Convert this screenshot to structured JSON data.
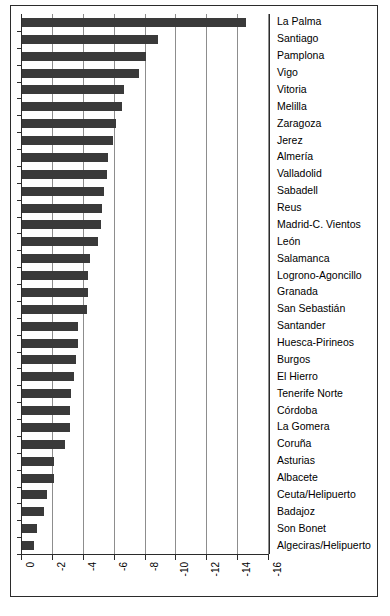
{
  "chart_data": {
    "type": "bar",
    "orientation": "horizontal",
    "title": "",
    "xlabel": "",
    "ylabel": "",
    "xlim": [
      0,
      -16
    ],
    "xticks": [
      0,
      -2,
      -4,
      -6,
      -8,
      -10,
      -12,
      -14,
      -16
    ],
    "xtick_labels": [
      "0",
      "-2",
      "-4",
      "-6",
      "-8",
      "-10",
      "-12",
      "-14",
      "-16"
    ],
    "grid": true,
    "grid_axis": "x",
    "legend": "none",
    "bar_color": "#3a3a3a",
    "axis_color": "#2b2b2b",
    "grid_color": "#8d8d8d",
    "background": "#ffffff",
    "categories": [
      "La Palma",
      "Santiago",
      "Pamplona",
      "Vigo",
      "Vitoria",
      "Melilla",
      "Zaragoza",
      "Jerez",
      "Almería",
      "Valladolid",
      "Sabadell",
      "Reus",
      "Madrid-C. Vientos",
      "León",
      "Salamanca",
      "Logrono-Agoncillo",
      "Granada",
      "San Sebastián",
      "Santander",
      "Huesca-Pirineos",
      "Burgos",
      "El Hierro",
      "Tenerife Norte",
      "Córdoba",
      "La Gomera",
      "Coruña",
      "Asturias",
      "Albacete",
      "Ceuta/Helipuerto",
      "Badajoz",
      "Son Bonet",
      "Algeciras/Helipuerto"
    ],
    "values": [
      -14.5,
      -8.8,
      -8.0,
      -7.6,
      -6.6,
      -6.5,
      -6.1,
      -5.9,
      -5.6,
      -5.5,
      -5.3,
      -5.2,
      -5.1,
      -4.9,
      -4.4,
      -4.3,
      -4.3,
      -4.2,
      -3.6,
      -3.6,
      -3.5,
      -3.4,
      -3.2,
      -3.1,
      -3.1,
      -2.8,
      -2.1,
      -2.1,
      -1.6,
      -1.4,
      -0.95,
      -0.8
    ]
  }
}
